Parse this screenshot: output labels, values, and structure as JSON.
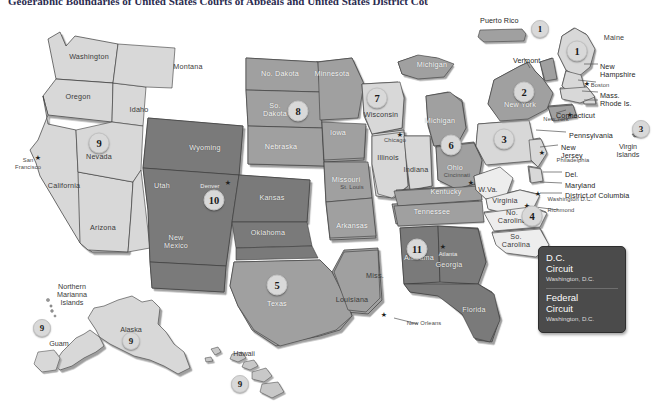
{
  "title": "Geographic Boundaries of United States Courts of Appeals and United States District Courts",
  "colors": {
    "circuit_dark": "#7a7a7a",
    "circuit_mid": "#a0a0a0",
    "circuit_light": "#d8d8d8",
    "circuit_pale": "#ededed",
    "outline": "#3a3a3a",
    "legend_bg": "#4b4b4b",
    "page_bg": "#ffffff",
    "title_color": "#2b2b4f"
  },
  "legend": {
    "name": "circuit-legend",
    "entries": [
      {
        "circuit": "D.C.",
        "line2": "Circuit",
        "location": "Washington, D.C."
      },
      {
        "circuit": "Federal",
        "line2": "Circuit",
        "location": "Washington, D.C."
      }
    ]
  },
  "badges": [
    {
      "id": "badge-1-maine",
      "number": "1",
      "x": 577,
      "y": 51,
      "size": "big",
      "tone": "lt"
    },
    {
      "id": "badge-1-puertorico",
      "number": "1",
      "x": 540,
      "y": 29,
      "size": "med",
      "tone": "lt"
    },
    {
      "id": "badge-2-newyork",
      "number": "2",
      "x": 524,
      "y": 92,
      "size": "big",
      "tone": "lt"
    },
    {
      "id": "badge-3-pennsylvania",
      "number": "3",
      "x": 504,
      "y": 139,
      "size": "big",
      "tone": "lt"
    },
    {
      "id": "badge-3-virginislands",
      "number": "3",
      "x": 641,
      "y": 129,
      "size": "med",
      "tone": "lt"
    },
    {
      "id": "badge-4-carolinas",
      "number": "4",
      "x": 532,
      "y": 216,
      "size": "big",
      "tone": "lt"
    },
    {
      "id": "badge-5-texas",
      "number": "5",
      "x": 277,
      "y": 285,
      "size": "big",
      "tone": "lt"
    },
    {
      "id": "badge-6-ohio",
      "number": "6",
      "x": 451,
      "y": 145,
      "size": "big",
      "tone": "lt"
    },
    {
      "id": "badge-7-wisconsin",
      "number": "7",
      "x": 377,
      "y": 98,
      "size": "big",
      "tone": "lt"
    },
    {
      "id": "badge-8-dakotas",
      "number": "8",
      "x": 298,
      "y": 111,
      "size": "big",
      "tone": "lt"
    },
    {
      "id": "badge-9-nevada",
      "number": "9",
      "x": 99,
      "y": 143,
      "size": "big",
      "tone": "lt"
    },
    {
      "id": "badge-9-guam",
      "number": "9",
      "x": 42,
      "y": 328,
      "size": "med",
      "tone": "lt"
    },
    {
      "id": "badge-9-alaska",
      "number": "9",
      "x": 131,
      "y": 341,
      "size": "med",
      "tone": "lt"
    },
    {
      "id": "badge-9-hawaii",
      "number": "9",
      "x": 240,
      "y": 384,
      "size": "med",
      "tone": "lt"
    },
    {
      "id": "badge-10-colorado",
      "number": "10",
      "x": 214,
      "y": 200,
      "size": "big",
      "tone": "lt"
    },
    {
      "id": "badge-11-alabama",
      "number": "11",
      "x": 417,
      "y": 249,
      "size": "big",
      "tone": "lt"
    }
  ],
  "states": [
    {
      "name": "Washington",
      "x": 89,
      "y": 57,
      "tone": "on-light"
    },
    {
      "name": "Oregon",
      "x": 78,
      "y": 97,
      "tone": "on-light"
    },
    {
      "name": "Idaho",
      "x": 139,
      "y": 110,
      "tone": "on-light"
    },
    {
      "name": "Montana",
      "x": 188,
      "y": 67,
      "tone": "on-light"
    },
    {
      "name": "California",
      "x": 64,
      "y": 186,
      "tone": "on-light"
    },
    {
      "name": "Nevada",
      "x": 99,
      "y": 157,
      "tone": "on-light"
    },
    {
      "name": "Arizona",
      "x": 103,
      "y": 228,
      "tone": "on-light"
    },
    {
      "name": "Utah",
      "x": 162,
      "y": 186,
      "tone": "on-dark"
    },
    {
      "name": "Wyoming",
      "x": 205,
      "y": 148,
      "tone": "on-dark"
    },
    {
      "name": "New\nMexico",
      "x": 176,
      "y": 242,
      "tone": "on-dark"
    },
    {
      "name": "No. Dakota",
      "x": 280,
      "y": 74,
      "tone": "on-mid"
    },
    {
      "name": "So.\nDakota",
      "x": 275,
      "y": 110,
      "tone": "on-mid"
    },
    {
      "name": "Nebraska",
      "x": 281,
      "y": 147,
      "tone": "on-mid"
    },
    {
      "name": "Minnesota",
      "x": 332,
      "y": 74,
      "tone": "on-mid"
    },
    {
      "name": "Iowa",
      "x": 338,
      "y": 133,
      "tone": "on-mid"
    },
    {
      "name": "Missouri",
      "x": 346,
      "y": 180,
      "tone": "on-mid"
    },
    {
      "name": "Arkansas",
      "x": 352,
      "y": 226,
      "tone": "on-mid"
    },
    {
      "name": "Kansas",
      "x": 272,
      "y": 198,
      "tone": "on-dark"
    },
    {
      "name": "Oklahoma",
      "x": 268,
      "y": 233,
      "tone": "on-dark"
    },
    {
      "name": "Texas",
      "x": 277,
      "y": 304,
      "tone": "on-mid"
    },
    {
      "name": "Louisiana",
      "x": 352,
      "y": 300,
      "tone": "on-light"
    },
    {
      "name": "Miss.",
      "x": 375,
      "y": 276,
      "tone": "on-light"
    },
    {
      "name": "Wisconsin",
      "x": 381,
      "y": 115,
      "tone": "on-light"
    },
    {
      "name": "Illinois",
      "x": 388,
      "y": 158,
      "tone": "on-light"
    },
    {
      "name": "Indiana",
      "x": 416,
      "y": 170,
      "tone": "on-light"
    },
    {
      "name": "Michigan",
      "x": 432,
      "y": 65,
      "tone": "on-mid"
    },
    {
      "name": "Michigan",
      "x": 440,
      "y": 121,
      "tone": "on-mid"
    },
    {
      "name": "Ohio",
      "x": 455,
      "y": 168,
      "tone": "on-mid"
    },
    {
      "name": "Kentucky",
      "x": 446,
      "y": 192,
      "tone": "on-mid"
    },
    {
      "name": "Tennessee",
      "x": 432,
      "y": 212,
      "tone": "on-mid"
    },
    {
      "name": "Alabama",
      "x": 419,
      "y": 258,
      "tone": "on-dark"
    },
    {
      "name": "Georgia",
      "x": 449,
      "y": 265,
      "tone": "on-dark"
    },
    {
      "name": "Florida",
      "x": 474,
      "y": 310,
      "tone": "on-dark"
    },
    {
      "name": "W.Va.",
      "x": 488,
      "y": 190,
      "tone": "on-light"
    },
    {
      "name": "Virginia",
      "x": 505,
      "y": 201,
      "tone": "on-light"
    },
    {
      "name": "No.\nCarolina",
      "x": 512,
      "y": 217,
      "tone": "on-light"
    },
    {
      "name": "So.\nCarolina",
      "x": 516,
      "y": 241,
      "tone": "on-light"
    },
    {
      "name": "New York",
      "x": 520,
      "y": 105,
      "tone": "on-mid"
    },
    {
      "name": "Maine",
      "x": 614,
      "y": 38,
      "tone": "on-light"
    }
  ],
  "cities": [
    {
      "name": "San\nFrancisco",
      "x": 28,
      "y": 164,
      "tone": "on-light"
    },
    {
      "name": "Denver",
      "x": 210,
      "y": 186,
      "tone": "on-dark"
    },
    {
      "name": "Chicago",
      "x": 395,
      "y": 140,
      "tone": "on-light"
    },
    {
      "name": "St. Louis",
      "x": 352,
      "y": 187,
      "tone": "on-mid"
    },
    {
      "name": "Cincinnati",
      "x": 457,
      "y": 175,
      "tone": "on-mid"
    },
    {
      "name": "Atlanta",
      "x": 448,
      "y": 254,
      "tone": "on-dark"
    },
    {
      "name": "New Orleans",
      "x": 424,
      "y": 323,
      "tone": "on-light"
    },
    {
      "name": "Boston",
      "x": 600,
      "y": 85,
      "tone": "on-light"
    },
    {
      "name": "New York",
      "x": 556,
      "y": 119,
      "tone": "on-light"
    },
    {
      "name": "Philadelphia",
      "x": 573,
      "y": 160,
      "tone": "on-light"
    },
    {
      "name": "Washington D.C.",
      "x": 570,
      "y": 199,
      "tone": "on-light"
    },
    {
      "name": "Richmond",
      "x": 561,
      "y": 210,
      "tone": "on-light"
    }
  ],
  "stars": [
    {
      "name": "star-san-francisco",
      "x": 38,
      "y": 157
    },
    {
      "name": "star-denver",
      "x": 228,
      "y": 182
    },
    {
      "name": "star-chicago",
      "x": 400,
      "y": 134
    },
    {
      "name": "star-cincinnati",
      "x": 471,
      "y": 182
    },
    {
      "name": "star-atlanta",
      "x": 443,
      "y": 246
    },
    {
      "name": "star-new-orleans",
      "x": 384,
      "y": 314
    },
    {
      "name": "star-boston",
      "x": 587,
      "y": 83
    },
    {
      "name": "star-new-york",
      "x": 570,
      "y": 114
    },
    {
      "name": "star-philadelphia",
      "x": 542,
      "y": 152
    },
    {
      "name": "star-washington-dc",
      "x": 538,
      "y": 193
    },
    {
      "name": "star-richmond",
      "x": 527,
      "y": 205
    }
  ],
  "callouts": [
    {
      "name": "callout-new-hampshire",
      "text": "New\nHampshire",
      "x": 600,
      "y": 63,
      "size": "normal"
    },
    {
      "name": "callout-mass",
      "text": "Mass.",
      "x": 600,
      "y": 92,
      "size": "normal"
    },
    {
      "name": "callout-rhode-island",
      "text": "Rhode Is.",
      "x": 600,
      "y": 100,
      "size": "normal"
    },
    {
      "name": "callout-connecticut",
      "text": "Connecticut",
      "x": 556,
      "y": 112,
      "size": "normal"
    },
    {
      "name": "callout-vermont",
      "text": "Vermont",
      "x": 513,
      "y": 57,
      "size": "normal"
    },
    {
      "name": "callout-pennsylvania",
      "text": "Pennsylvania",
      "x": 569,
      "y": 132,
      "size": "normal"
    },
    {
      "name": "callout-new-jersey",
      "text": "New\nJersey",
      "x": 561,
      "y": 144,
      "size": "normal"
    },
    {
      "name": "callout-delaware",
      "text": "Del.",
      "x": 565,
      "y": 171,
      "size": "normal"
    },
    {
      "name": "callout-maryland",
      "text": "Maryland",
      "x": 565,
      "y": 182,
      "size": "normal"
    },
    {
      "name": "callout-district-of-columbia",
      "text": "District of Columbia",
      "x": 565,
      "y": 192,
      "size": "normal"
    },
    {
      "name": "callout-puerto-rico",
      "text": "Puerto Rico",
      "x": 480,
      "y": 17,
      "size": "normal"
    },
    {
      "name": "callout-virgin-islands",
      "text": "Virgin\nIslands",
      "x": 628,
      "y": 143,
      "size": "island"
    },
    {
      "name": "callout-northern-marianna",
      "text": "Northern\nMarianna\nIslands",
      "x": 72,
      "y": 283,
      "size": "island"
    },
    {
      "name": "callout-guam",
      "text": "Guam",
      "x": 59,
      "y": 340,
      "size": "island"
    },
    {
      "name": "callout-alaska",
      "text": "Alaska",
      "x": 131,
      "y": 326,
      "size": "island"
    },
    {
      "name": "callout-hawaii",
      "text": "Hawaii",
      "x": 244,
      "y": 350,
      "size": "island"
    }
  ]
}
